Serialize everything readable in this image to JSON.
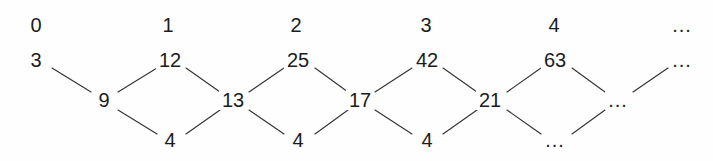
{
  "diagram": {
    "type": "lattice-graph",
    "background_color": "#fefefe",
    "edge_color": "#333333",
    "text_color": "#1c1c1c",
    "rows": {
      "index_row_y": 25,
      "upper_row_y": 60,
      "middle_row_y": 100,
      "lower_row_y": 140
    },
    "index_labels": [
      {
        "text": "0",
        "x": 36
      },
      {
        "text": "1",
        "x": 168
      },
      {
        "text": "2",
        "x": 296
      },
      {
        "text": "3",
        "x": 426
      },
      {
        "text": "4",
        "x": 554
      },
      {
        "text": "...",
        "x": 682
      }
    ],
    "upper_nodes": [
      {
        "text": "3",
        "x": 36
      },
      {
        "text": "12",
        "x": 170
      },
      {
        "text": "25",
        "x": 298
      },
      {
        "text": "42",
        "x": 427
      },
      {
        "text": "63",
        "x": 555
      },
      {
        "text": "...",
        "x": 682
      }
    ],
    "middle_nodes": [
      {
        "text": "9",
        "x": 104
      },
      {
        "text": "13",
        "x": 233
      },
      {
        "text": "17",
        "x": 360
      },
      {
        "text": "21",
        "x": 490
      },
      {
        "text": "...",
        "x": 618
      }
    ],
    "lower_nodes": [
      {
        "text": "4",
        "x": 170
      },
      {
        "text": "4",
        "x": 298
      },
      {
        "text": "4",
        "x": 427
      },
      {
        "text": "...",
        "x": 555
      }
    ],
    "edges": [
      {
        "x1": 52,
        "y1": 68,
        "x2": 91,
        "y2": 92,
        "from": "3",
        "to": "9"
      },
      {
        "x1": 118,
        "y1": 92,
        "x2": 157,
        "y2": 68,
        "from": "9",
        "to": "12"
      },
      {
        "x1": 118,
        "y1": 110,
        "x2": 157,
        "y2": 134,
        "from": "9",
        "to": "4"
      },
      {
        "x1": 186,
        "y1": 68,
        "x2": 220,
        "y2": 92,
        "from": "12",
        "to": "13"
      },
      {
        "x1": 186,
        "y1": 134,
        "x2": 220,
        "y2": 110,
        "from": "4",
        "to": "13"
      },
      {
        "x1": 249,
        "y1": 92,
        "x2": 284,
        "y2": 68,
        "from": "13",
        "to": "25"
      },
      {
        "x1": 249,
        "y1": 110,
        "x2": 284,
        "y2": 134,
        "from": "13",
        "to": "4"
      },
      {
        "x1": 315,
        "y1": 68,
        "x2": 348,
        "y2": 92,
        "from": "25",
        "to": "17"
      },
      {
        "x1": 315,
        "y1": 134,
        "x2": 348,
        "y2": 110,
        "from": "4",
        "to": "17"
      },
      {
        "x1": 375,
        "y1": 92,
        "x2": 412,
        "y2": 68,
        "from": "17",
        "to": "42"
      },
      {
        "x1": 375,
        "y1": 110,
        "x2": 412,
        "y2": 134,
        "from": "17",
        "to": "4"
      },
      {
        "x1": 443,
        "y1": 68,
        "x2": 477,
        "y2": 92,
        "from": "42",
        "to": "21"
      },
      {
        "x1": 443,
        "y1": 134,
        "x2": 477,
        "y2": 110,
        "from": "4",
        "to": "21"
      },
      {
        "x1": 507,
        "y1": 92,
        "x2": 541,
        "y2": 68,
        "from": "21",
        "to": "63"
      },
      {
        "x1": 507,
        "y1": 110,
        "x2": 541,
        "y2": 134,
        "from": "21",
        "to": "..."
      },
      {
        "x1": 572,
        "y1": 68,
        "x2": 605,
        "y2": 92,
        "from": "63",
        "to": "..."
      },
      {
        "x1": 572,
        "y1": 134,
        "x2": 605,
        "y2": 110,
        "from": "...",
        "to": "..."
      },
      {
        "x1": 633,
        "y1": 92,
        "x2": 668,
        "y2": 68,
        "from": "...",
        "to": "..."
      }
    ]
  }
}
